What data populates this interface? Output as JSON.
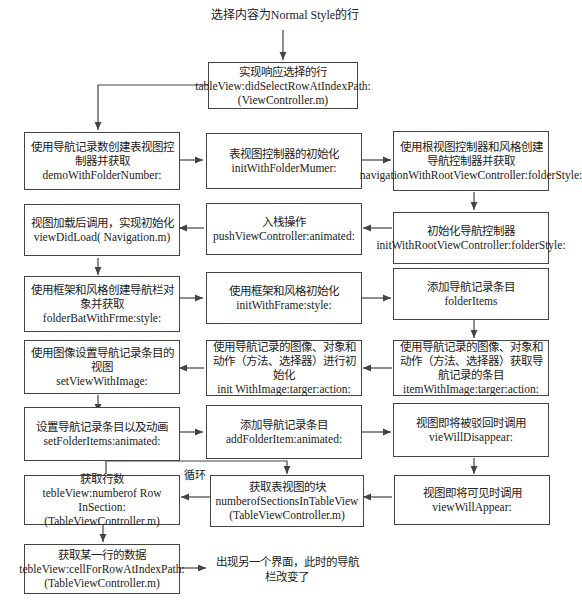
{
  "start_label": "选择内容为Normal Style的行",
  "end_label": "出现另一个界面，此时的导航栏改变了",
  "loop_label": "循环",
  "nodes": {
    "n0": {
      "zh": "实现响应选择的行",
      "en": "tableView:didSelectRowAtIndexPath:(ViewController.m)"
    },
    "n1": {
      "zh": "使用导航记录数创建表视图控制器并获取",
      "en": "demoWithFolderNumber:"
    },
    "n2": {
      "zh": "表视图控制器的初始化",
      "en": "initWithFolderMumer:"
    },
    "n3": {
      "zh": "使用根视图控制器和风格创建导航控制器并获取",
      "en": "navigationWithRootViewController:folderStyle:"
    },
    "n4": {
      "zh": "初始化导航控制器",
      "en": "initWithRootViewController:folderStyle:"
    },
    "n5": {
      "zh": "入栈操作",
      "en": "pushViewController:animated:"
    },
    "n6": {
      "zh": "视图加载后调用，实现初始化",
      "en": "viewDidLoad( Navigation.m)"
    },
    "n7": {
      "zh": "使用框架和风格创建导航栏对象并获取",
      "en": "folderBatWithFrme:style:"
    },
    "n8": {
      "zh": "使用框架和风格初始化",
      "en": "initWithFrame:style:"
    },
    "n9": {
      "zh": "添加导航记录条目",
      "en": "folderItems"
    },
    "n10": {
      "zh": "使用导航记录的图像、对象和动作（方法、选择器）获取导航记录的条目",
      "en": "itemWithImage:targer:action:"
    },
    "n11": {
      "zh": "使用导航记录的图像、对象和动作（方法、选择器）进行初始化",
      "en": "init WithImage:targer:action:"
    },
    "n12": {
      "zh": "使用图像设置导航记录条目的视图",
      "en": "setViewWithImage:"
    },
    "n13": {
      "zh": "设置导航记录条目以及动画",
      "en": "setFolderItems:animated:"
    },
    "n14": {
      "zh": "添加导航记录条目",
      "en": "addFolderItem:animated:"
    },
    "n15": {
      "zh": "视图即将被驳回时调用",
      "en": "vieWillDisappear:"
    },
    "n16": {
      "zh": "视图即将可见时调用",
      "en": "viewWillAppear:"
    },
    "n17": {
      "zh": "获取表视图的块",
      "en": "numberofSectionsInTableView (TableViewController.m)"
    },
    "n18": {
      "zh": "获取行数",
      "en": "tebleView:numberof Row InSection:(TableViewController.m)"
    },
    "n19": {
      "zh": "获取某一行的数据",
      "en": "tebleView:cellForRowAtIndexPath:(TableViewController.m)"
    }
  }
}
